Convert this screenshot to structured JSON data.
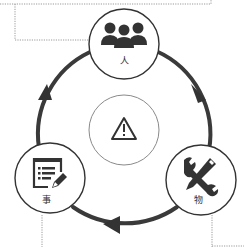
{
  "diagram": {
    "type": "cycle",
    "colors": {
      "stroke": "#333333",
      "ring": "#3a3a3a",
      "dotted": "#9a9a9a",
      "background": "#ffffff",
      "center_stroke": "#888888"
    },
    "nodes": [
      {
        "id": "ren",
        "label": "人",
        "icon": "people-group-icon",
        "position": "top"
      },
      {
        "id": "wu",
        "label": "物",
        "icon": "tools-wrench-pencil-icon",
        "position": "bottom-right"
      },
      {
        "id": "shi",
        "label": "事",
        "icon": "checklist-edit-icon",
        "position": "bottom-left"
      }
    ],
    "center": {
      "icon": "warning-triangle-icon"
    },
    "flow": [
      "人",
      "物",
      "事",
      "人"
    ],
    "direction": "clockwise"
  }
}
